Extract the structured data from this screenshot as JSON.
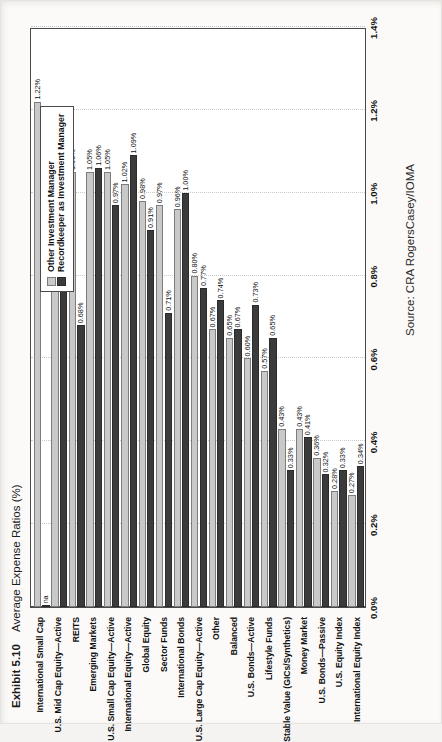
{
  "exhibit": {
    "number": "Exhibit 5.10",
    "title": "Average Expense Ratios (%)",
    "source": "Source: CRA RogersCasey/IOMA"
  },
  "legend": {
    "items": [
      {
        "label": "Other Investment Manager",
        "color": "#c9c9c9"
      },
      {
        "label": "Recordkeeper as Investment Manager",
        "color": "#3b3b3b"
      }
    ]
  },
  "chart_data": {
    "type": "bar",
    "orientation": "horizontal",
    "title": "Average Expense Ratios (%)",
    "xlabel": "",
    "ylabel": "",
    "xlim": [
      0.0,
      1.4
    ],
    "xticks": [
      "0.0%",
      "0.2%",
      "0.4%",
      "0.6%",
      "0.8%",
      "1.0%",
      "1.2%",
      "1.4%"
    ],
    "xtick_values": [
      0.0,
      0.2,
      0.4,
      0.6,
      0.8,
      1.0,
      1.2,
      1.4
    ],
    "grid": true,
    "legend_position": "top-right",
    "categories": [
      "International Small Cap",
      "U.S. Mid Cap Equity—Active",
      "REITS",
      "Emerging Markets",
      "U.S. Small Cap Equity—Active",
      "International Equity—Active",
      "Global Equity",
      "Sector Funds",
      "International Bonds",
      "U.S. Large Cap Equity—Active",
      "Other",
      "Balanced",
      "U.S. Bonds—Active",
      "Lifestyle Funds",
      "Stable Value (GICs/Synthetics)",
      "Money Market",
      "U.S. Bonds—Passive",
      "U.S. Equity Index",
      "International Equity Index"
    ],
    "series": [
      {
        "name": "Other Investment Manager",
        "color": "#c9c9c9",
        "values": [
          1.22,
          1.09,
          1.05,
          1.05,
          1.05,
          1.02,
          0.98,
          0.97,
          0.96,
          0.8,
          0.67,
          0.65,
          0.6,
          0.57,
          0.43,
          0.43,
          0.36,
          0.28,
          0.27
        ],
        "labels": [
          "1.22%",
          "1.09%",
          "1.05%",
          "1.05%",
          "1.05%",
          "1.02%",
          "0.98%",
          "0.97%",
          "0.96%",
          "0.80%",
          "0.67%",
          "0.65%",
          "0.60%",
          "0.57%",
          "0.43%",
          "0.43%",
          "0.36%",
          "0.28%",
          "0.27%"
        ]
      },
      {
        "name": "Recordkeeper as Investment Manager",
        "color": "#3b3b3b",
        "values": [
          null,
          0.87,
          0.68,
          1.06,
          0.97,
          1.09,
          0.91,
          0.71,
          1.0,
          0.77,
          0.74,
          0.67,
          0.73,
          0.65,
          0.33,
          0.41,
          0.32,
          0.33,
          0.34
        ],
        "labels": [
          "na",
          "0.87%",
          "0.68%",
          "1.06%",
          "0.97%",
          "1.09%",
          "0.91%",
          "0.71%",
          "1.00%",
          "0.77%",
          "0.74%",
          "0.67%",
          "0.73%",
          "0.65%",
          "0.33%",
          "0.41%",
          "0.32%",
          "0.33%",
          "0.34%"
        ]
      }
    ]
  }
}
